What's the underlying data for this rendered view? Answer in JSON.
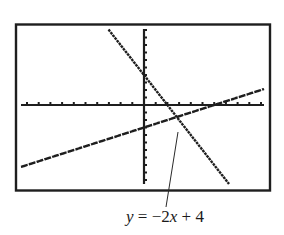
{
  "chart_data": {
    "type": "line",
    "title": "",
    "xlabel": "",
    "ylabel": "",
    "xlim": [
      -10,
      10
    ],
    "ylim": [
      -10,
      10
    ],
    "xscl": 1,
    "yscl": 1,
    "grid": false,
    "legend": "none",
    "series": [
      {
        "name": "y = -2x + 4",
        "slope": -2,
        "intercept": 4,
        "x": [
          -3,
          10
        ],
        "y": [
          10,
          -16
        ],
        "style": "pixelated"
      },
      {
        "name": "y = 0.5x - 3",
        "slope": 0.5,
        "intercept": -3,
        "x": [
          -10.5,
          10.2
        ],
        "y": [
          -8.25,
          2.1
        ],
        "style": "pixelated"
      }
    ],
    "annotations": [
      {
        "text": "y = −2x + 4",
        "points_to": "y = -2x + 4",
        "position": "below-graph"
      }
    ]
  },
  "screen": {
    "frame_color": "#1e1e1e",
    "line_color": "#1e1e1e",
    "background": "#ffffff"
  },
  "annotation": {
    "label": "y = −2x + 4",
    "var_y": "y",
    "eq": " = −2",
    "var_x": "x",
    "rest": " + 4"
  }
}
